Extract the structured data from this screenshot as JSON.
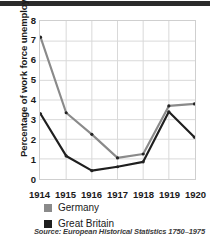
{
  "figure": {
    "top_rule_color": "#2b2b2b",
    "background": "#ffffff"
  },
  "source": {
    "text": "Source: European Historical Statistics 1750–1975"
  },
  "legend": {
    "position": "below-axis-left",
    "items": [
      {
        "label": "Germany",
        "color": "#8a8a8a",
        "swatch_name": "legend-swatch-germany"
      },
      {
        "label": "Great Britain",
        "color": "#1f1f1f",
        "swatch_name": "legend-swatch-great-britain"
      }
    ]
  },
  "chart_data": {
    "type": "line",
    "title": "",
    "xlabel": "",
    "ylabel": "Percentage of work force unemployed",
    "categories": [
      "1914",
      "1915",
      "1916",
      "1917",
      "1918",
      "1919",
      "1920"
    ],
    "x": [
      1914,
      1915,
      1916,
      1917,
      1918,
      1919,
      1920
    ],
    "xlim": [
      1914,
      1920
    ],
    "ylim": [
      0,
      8
    ],
    "yticks": [
      0,
      1,
      2,
      3,
      4,
      5,
      6,
      7,
      8
    ],
    "ytick_labels": [
      "0",
      "1",
      "2",
      "3",
      "4",
      "5",
      "6",
      "7",
      "8"
    ],
    "grid": true,
    "grid_color": "#d8d8d8",
    "legend_position": "bottom-left",
    "series": [
      {
        "name": "Germany",
        "color": "#8a8a8a",
        "marker": "dot",
        "values": [
          7.2,
          3.35,
          2.25,
          1.05,
          1.25,
          3.7,
          3.8
        ]
      },
      {
        "name": "Great Britain",
        "color": "#1f1f1f",
        "marker": "dot",
        "values": [
          3.3,
          1.15,
          0.4,
          0.6,
          0.85,
          3.4,
          2.1
        ]
      }
    ]
  }
}
